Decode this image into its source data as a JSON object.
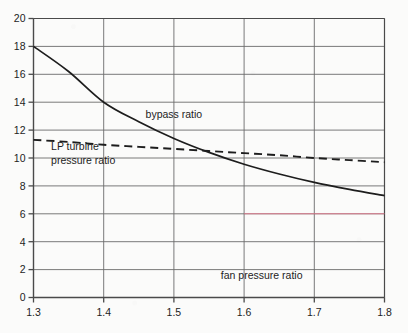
{
  "chart_data": {
    "type": "line",
    "title": "",
    "xlabel": "fan pressure ratio",
    "ylabel": "",
    "xlim": [
      1.3,
      1.8
    ],
    "ylim": [
      0,
      20
    ],
    "grid": true,
    "legend_position": "inline-annotations",
    "x_ticks": [
      "1.3",
      "1.4",
      "1.5",
      "1.6",
      "1.7",
      "1.8"
    ],
    "x_tick_values": [
      1.3,
      1.4,
      1.5,
      1.6,
      1.7,
      1.8
    ],
    "y_ticks": [
      "0",
      "2",
      "4",
      "6",
      "8",
      "10",
      "12",
      "14",
      "16",
      "18",
      "20"
    ],
    "y_tick_values": [
      0,
      2,
      4,
      6,
      8,
      10,
      12,
      14,
      16,
      18,
      20
    ],
    "x": [
      1.3,
      1.35,
      1.4,
      1.45,
      1.5,
      1.55,
      1.6,
      1.65,
      1.7,
      1.75,
      1.8
    ],
    "series": [
      {
        "name": "bypass ratio",
        "style": "solid",
        "color": "#1d1d1d",
        "label_x": 1.5,
        "label_y": 12.9,
        "values": [
          18.0,
          16.2,
          14.0,
          12.6,
          11.4,
          10.4,
          9.55,
          8.85,
          8.25,
          7.75,
          7.3
        ]
      },
      {
        "name": "LP turbine pressure ratio",
        "style": "dashed",
        "color": "#1d1d1d",
        "label_x": 1.33,
        "label_y": 10.5,
        "label_line1": "LP turbine",
        "label_line2": "pressure ratio",
        "values": [
          11.3,
          11.15,
          10.95,
          10.8,
          10.65,
          10.5,
          10.35,
          10.2,
          10.0,
          9.85,
          9.7
        ]
      }
    ],
    "annotations": [
      {
        "text": "bypass ratio",
        "x": 1.5,
        "y": 12.9
      },
      {
        "text": "LP turbine",
        "x": 1.325,
        "y": 10.55
      },
      {
        "text": "pressure ratio",
        "x": 1.325,
        "y": 9.6
      },
      {
        "text": "fan pressure ratio",
        "x": 1.625,
        "y": 1.35
      }
    ],
    "marker_lines": [
      {
        "name": "red-highlight-line",
        "orientation": "horizontal",
        "y": 6,
        "x_start": 1.6,
        "x_end": 1.8,
        "color": "#e8778c"
      }
    ]
  },
  "colors": {
    "background": "#fbfbfa",
    "axis": "#4a4a4a",
    "grid": "#6b6b6b",
    "curve": "#1d1d1d",
    "text": "#1d1d1d",
    "highlight": "#e8778c"
  }
}
